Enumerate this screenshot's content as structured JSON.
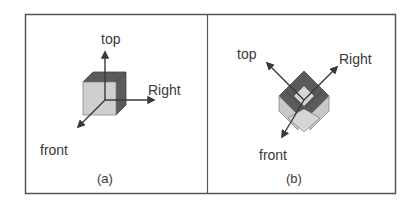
{
  "figure": {
    "panels": [
      {
        "id": "a",
        "caption": "(a)",
        "labels": {
          "top": "top",
          "right": "Right",
          "front": "front"
        },
        "view": "oblique cube with three axes"
      },
      {
        "id": "b",
        "caption": "(b)",
        "labels": {
          "top": "top",
          "right": "Right",
          "front": "front"
        },
        "view": "isometric cube rotated with three axes"
      }
    ],
    "colors": {
      "frame": "#555555",
      "dark_face": "#5a5a5a",
      "light_face": "#cfcfcf",
      "mid_face": "#b8b8b8",
      "arrow": "#3a3a3a",
      "text": "#3a3a3a"
    }
  }
}
